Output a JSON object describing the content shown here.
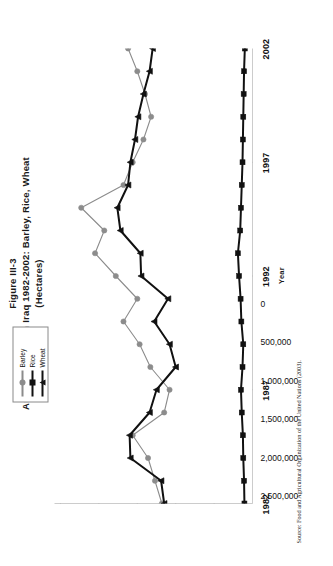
{
  "figure": {
    "number": "Figure III-3",
    "title": "Area Cultivated in Iraq 1982-2002: Barley, Rice, Wheat",
    "subtitle": "(Hectares)",
    "source": "Source: Food and Agricultural Organization of the United Nations (2003)."
  },
  "legend": {
    "position": "top-center-inside",
    "entries": [
      {
        "label": "Barley",
        "color": "#8c8c8c",
        "marker": "circle"
      },
      {
        "label": "Rice",
        "color": "#111111",
        "marker": "square"
      },
      {
        "label": "Wheat",
        "color": "#111111",
        "marker": "triangle"
      }
    ]
  },
  "axes": {
    "x_label": "Year",
    "x_ticks": [
      "1982",
      "1987",
      "1992",
      "1997",
      "2002"
    ],
    "y_ticks": [
      "0",
      "500,000",
      "1,000,000",
      "1,500,000",
      "2,000,000",
      "2,500,000"
    ]
  },
  "chart_data": {
    "type": "line",
    "title": "Area Cultivated in Iraq 1982-2002: Barley, Rice, Wheat (Hectares)",
    "xlabel": "Year",
    "ylabel": "Hectares",
    "ylim": [
      0,
      2500000
    ],
    "xlim": [
      1982,
      2002
    ],
    "grid": false,
    "legend_position": "top-center-inside",
    "x": [
      1982,
      1983,
      1984,
      1985,
      1986,
      1987,
      1988,
      1989,
      1990,
      1991,
      1992,
      1993,
      1994,
      1995,
      1996,
      1997,
      1998,
      1999,
      2000,
      2001,
      2002
    ],
    "categories": [
      "1982",
      "1983",
      "1984",
      "1985",
      "1986",
      "1987",
      "1988",
      "1989",
      "1990",
      "1991",
      "1992",
      "1993",
      "1994",
      "1995",
      "1996",
      "1997",
      "1998",
      "1999",
      "2000",
      "2001",
      "2002"
    ],
    "series": [
      {
        "name": "Barley",
        "color": "#8c8c8c",
        "marker": "circle",
        "values": [
          1180000,
          1270000,
          1360000,
          1560000,
          1150000,
          1080000,
          1330000,
          1470000,
          1680000,
          1500000,
          1780000,
          2050000,
          1930000,
          2230000,
          1680000,
          1560000,
          1420000,
          1320000,
          1400000,
          1500000,
          1620000
        ]
      },
      {
        "name": "Rice",
        "color": "#111111",
        "marker": "square",
        "values": [
          105000,
          110000,
          120000,
          125000,
          140000,
          150000,
          130000,
          120000,
          145000,
          155000,
          175000,
          190000,
          160000,
          150000,
          140000,
          130000,
          125000,
          120000,
          115000,
          110000,
          100000
        ]
      },
      {
        "name": "Wheat",
        "color": "#111111",
        "marker": "triangle",
        "values": [
          1150000,
          1190000,
          1590000,
          1600000,
          1340000,
          1250000,
          1000000,
          1080000,
          1280000,
          1100000,
          1450000,
          1460000,
          1720000,
          1760000,
          1620000,
          1590000,
          1530000,
          1490000,
          1420000,
          1340000,
          1300000
        ]
      }
    ]
  }
}
